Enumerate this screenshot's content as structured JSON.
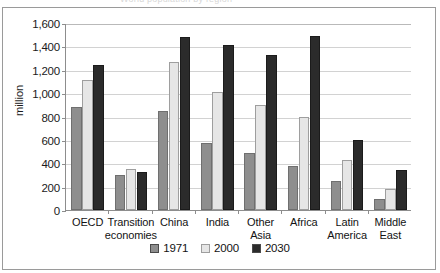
{
  "figure": {
    "faint_title": "World population by region"
  },
  "axis": {
    "y_title": "million",
    "y_ticks": [
      "1,600",
      "1,400",
      "1,200",
      "1,000",
      "800",
      "600",
      "400",
      "200",
      "0"
    ]
  },
  "legend": {
    "items": [
      {
        "label": "1971",
        "color": "#8e8e8e",
        "name": "legend-swatch-1971"
      },
      {
        "label": "2000",
        "color": "#e6e6e6",
        "name": "legend-swatch-2000"
      },
      {
        "label": "2030",
        "color": "#2b2b2b",
        "name": "legend-swatch-2030"
      }
    ]
  },
  "categories": [
    {
      "line1": "OECD",
      "line2": ""
    },
    {
      "line1": "Transition",
      "line2": "economies"
    },
    {
      "line1": "China",
      "line2": ""
    },
    {
      "line1": "India",
      "line2": ""
    },
    {
      "line1": "Other",
      "line2": "Asia"
    },
    {
      "line1": "Africa",
      "line2": ""
    },
    {
      "line1": "Latin",
      "line2": "America"
    },
    {
      "line1": "Middle",
      "line2": "East"
    }
  ],
  "chart_data": {
    "type": "bar",
    "title": "",
    "xlabel": "",
    "ylabel": "million",
    "ylim": [
      0,
      1600
    ],
    "ytick_step": 200,
    "grid": true,
    "legend_position": "bottom-center",
    "categories": [
      "OECD",
      "Transition economies",
      "China",
      "India",
      "Other Asia",
      "Africa",
      "Latin America",
      "Middle East"
    ],
    "series": [
      {
        "name": "1971",
        "color": "#8e8e8e",
        "values": [
          880,
          300,
          850,
          570,
          490,
          380,
          250,
          90
        ]
      },
      {
        "name": "2000",
        "color": "#e6e6e6",
        "values": [
          1110,
          350,
          1270,
          1010,
          900,
          800,
          430,
          180
        ]
      },
      {
        "name": "2030",
        "color": "#2b2b2b",
        "values": [
          1245,
          325,
          1480,
          1410,
          1330,
          1490,
          600,
          340
        ]
      }
    ]
  }
}
